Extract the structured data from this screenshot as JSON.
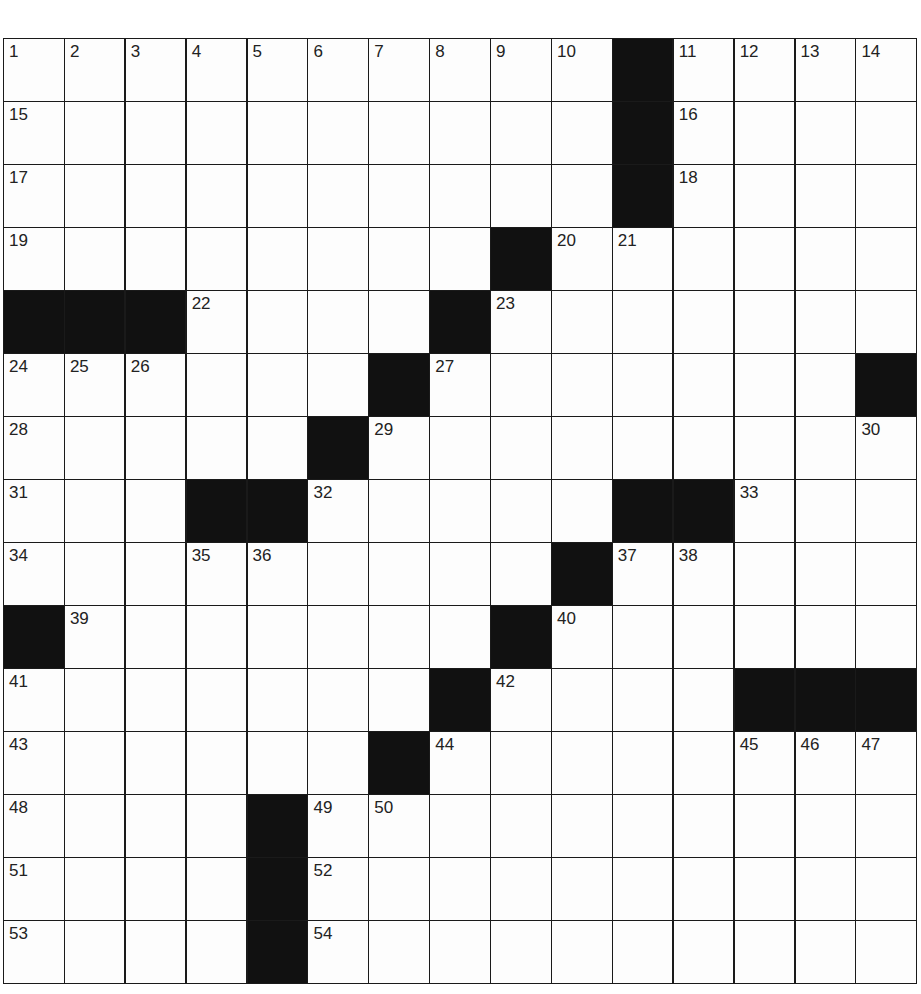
{
  "puzzle": {
    "rows": 15,
    "cols": 15,
    "layout": [
      "..........#....",
      "..........#....",
      "..........#....",
      "........#......",
      "###....#.......",
      "......#.......#",
      ".....#.........",
      "...##.....##...",
      ".........#.....",
      "#.......#......",
      ".......#....###",
      "......#........",
      "....#..........",
      "....#..........",
      "....#.........."
    ],
    "numbers": [
      {
        "r": 0,
        "c": 0,
        "n": "1"
      },
      {
        "r": 0,
        "c": 1,
        "n": "2"
      },
      {
        "r": 0,
        "c": 2,
        "n": "3"
      },
      {
        "r": 0,
        "c": 3,
        "n": "4"
      },
      {
        "r": 0,
        "c": 4,
        "n": "5"
      },
      {
        "r": 0,
        "c": 5,
        "n": "6"
      },
      {
        "r": 0,
        "c": 6,
        "n": "7"
      },
      {
        "r": 0,
        "c": 7,
        "n": "8"
      },
      {
        "r": 0,
        "c": 8,
        "n": "9"
      },
      {
        "r": 0,
        "c": 9,
        "n": "10"
      },
      {
        "r": 0,
        "c": 11,
        "n": "11"
      },
      {
        "r": 0,
        "c": 12,
        "n": "12"
      },
      {
        "r": 0,
        "c": 13,
        "n": "13"
      },
      {
        "r": 0,
        "c": 14,
        "n": "14"
      },
      {
        "r": 1,
        "c": 0,
        "n": "15"
      },
      {
        "r": 1,
        "c": 11,
        "n": "16"
      },
      {
        "r": 2,
        "c": 0,
        "n": "17"
      },
      {
        "r": 2,
        "c": 11,
        "n": "18"
      },
      {
        "r": 3,
        "c": 0,
        "n": "19"
      },
      {
        "r": 3,
        "c": 9,
        "n": "20"
      },
      {
        "r": 3,
        "c": 10,
        "n": "21"
      },
      {
        "r": 4,
        "c": 3,
        "n": "22"
      },
      {
        "r": 4,
        "c": 8,
        "n": "23"
      },
      {
        "r": 5,
        "c": 0,
        "n": "24"
      },
      {
        "r": 5,
        "c": 1,
        "n": "25"
      },
      {
        "r": 5,
        "c": 2,
        "n": "26"
      },
      {
        "r": 5,
        "c": 7,
        "n": "27"
      },
      {
        "r": 6,
        "c": 0,
        "n": "28"
      },
      {
        "r": 6,
        "c": 6,
        "n": "29"
      },
      {
        "r": 6,
        "c": 14,
        "n": "30"
      },
      {
        "r": 7,
        "c": 0,
        "n": "31"
      },
      {
        "r": 7,
        "c": 5,
        "n": "32"
      },
      {
        "r": 7,
        "c": 12,
        "n": "33"
      },
      {
        "r": 8,
        "c": 0,
        "n": "34"
      },
      {
        "r": 8,
        "c": 3,
        "n": "35"
      },
      {
        "r": 8,
        "c": 4,
        "n": "36"
      },
      {
        "r": 8,
        "c": 10,
        "n": "37"
      },
      {
        "r": 8,
        "c": 11,
        "n": "38"
      },
      {
        "r": 9,
        "c": 1,
        "n": "39"
      },
      {
        "r": 9,
        "c": 9,
        "n": "40"
      },
      {
        "r": 10,
        "c": 0,
        "n": "41"
      },
      {
        "r": 10,
        "c": 8,
        "n": "42"
      },
      {
        "r": 11,
        "c": 0,
        "n": "43"
      },
      {
        "r": 11,
        "c": 7,
        "n": "44"
      },
      {
        "r": 11,
        "c": 12,
        "n": "45"
      },
      {
        "r": 11,
        "c": 13,
        "n": "46"
      },
      {
        "r": 11,
        "c": 14,
        "n": "47"
      },
      {
        "r": 12,
        "c": 0,
        "n": "48"
      },
      {
        "r": 12,
        "c": 5,
        "n": "49"
      },
      {
        "r": 12,
        "c": 6,
        "n": "50"
      },
      {
        "r": 13,
        "c": 0,
        "n": "51"
      },
      {
        "r": 13,
        "c": 5,
        "n": "52"
      },
      {
        "r": 14,
        "c": 0,
        "n": "53"
      },
      {
        "r": 14,
        "c": 5,
        "n": "54"
      }
    ],
    "colors": {
      "black_square": "#111111",
      "white_square": "#fdfdfd",
      "grid_line": "#1a1a1a"
    }
  }
}
